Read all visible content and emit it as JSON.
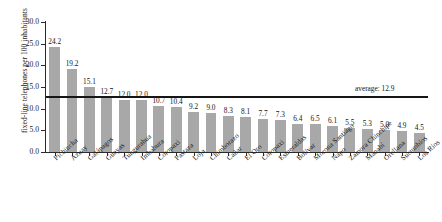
{
  "chart_data": {
    "type": "bar",
    "title": "",
    "subtitle": "",
    "xlabel": "",
    "ylabel": "fixed-line telephones per 100 inhabitants",
    "ylim": [
      0.0,
      30.0
    ],
    "ytick_labels": [
      "0.0",
      "5.0",
      "10.0",
      "15.0",
      "20.0",
      "25.0",
      "30.0"
    ],
    "ytick_values": [
      0.0,
      5.0,
      10.0,
      15.0,
      20.0,
      25.0,
      30.0
    ],
    "grid": false,
    "legend": false,
    "bar_color": "#a8a8a8",
    "axis_color": "#2b2b2b",
    "categories": [
      "Pichincha",
      "Azuay",
      "Galápagos",
      "Guayas",
      "Tungurahua",
      "Imbabura",
      "Cotopaxi",
      "Pastaza",
      "Loja",
      "Chimborazo",
      "Cañar",
      "El Oro",
      "Cotopaxi",
      "Esmeraldas",
      "Bolívar",
      "Morona Santiago",
      "Napo",
      "Zamora Chinchipe",
      "Manabí",
      "Orellana",
      "Sucumbíos",
      "Los Ríos"
    ],
    "values": [
      24.2,
      19.2,
      15.1,
      12.7,
      12.0,
      12.0,
      10.7,
      10.4,
      9.2,
      9.0,
      8.3,
      8.1,
      7.7,
      7.3,
      6.4,
      6.5,
      6.1,
      5.5,
      5.3,
      5.0,
      4.9,
      4.5
    ],
    "value_labels": [
      "24.2",
      "19.2",
      "15.1",
      "12.7",
      "12.0",
      "12.0",
      "10.7",
      "10.4",
      "9.2",
      "9.0",
      "8.3",
      "8.1",
      "7.7",
      "7.3",
      "6.4",
      "6.5",
      "6.1",
      "5.5",
      "5.3",
      "5.0",
      "4.9",
      "4.5"
    ],
    "annotations": [
      {
        "name": "average-line",
        "label": "average: 12.9",
        "value": 12.9,
        "orientation": "horizontal",
        "color": "#151515"
      }
    ]
  }
}
